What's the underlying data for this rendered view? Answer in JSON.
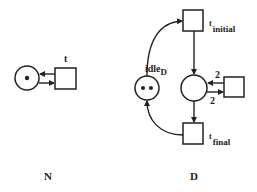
{
  "colors": {
    "stroke": "#222222",
    "background": "#ffffff"
  },
  "net_n": {
    "caption": "N",
    "place": {
      "tokens": 1
    },
    "transition": {
      "label": "t"
    }
  },
  "net_d": {
    "caption": "D",
    "idle_place": {
      "label_main": "idle",
      "label_sub": "D",
      "tokens": 2
    },
    "t_initial": {
      "label_main": "t",
      "label_sub": "initial"
    },
    "t_final": {
      "label_main": "t",
      "label_sub": "final"
    },
    "center_place": {
      "tokens": 0
    },
    "side_transition": {
      "arc_in_weight": "2",
      "arc_out_weight": "2"
    }
  }
}
